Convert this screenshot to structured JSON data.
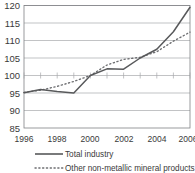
{
  "chart_data": {
    "type": "line",
    "title": "",
    "subtitle": "",
    "xlabel": "",
    "ylabel": "",
    "xlim": [
      1996,
      2006
    ],
    "ylim": [
      85,
      120
    ],
    "grid": true,
    "legend_position": "bottom",
    "y_ticks": [
      120,
      115,
      110,
      105,
      100,
      95,
      90,
      85
    ],
    "y_tick_labels": [
      "120",
      "115",
      "110",
      "105",
      "100",
      "95",
      "90",
      "85"
    ],
    "x_ticks": [
      1996,
      1998,
      2000,
      2002,
      2004,
      2006
    ],
    "x_tick_labels": [
      "1996",
      "1998",
      "2000",
      "2002",
      "2004",
      "2006"
    ],
    "x_minor_ticks": [
      1997,
      1999,
      2001,
      2003,
      2005
    ],
    "x": [
      1996,
      1997,
      1998,
      1999,
      2000,
      2001,
      2002,
      2003,
      2004,
      2005,
      2006
    ],
    "series": [
      {
        "name": "Total industry",
        "style": "solid",
        "color": "#58595b",
        "values": [
          95.1,
          96.0,
          95.4,
          95.0,
          100.0,
          101.9,
          101.8,
          105.0,
          107.5,
          112.5,
          119.5
        ]
      },
      {
        "name": "Other non-metallic mineral products",
        "style": "dotted",
        "color": "#6d6e71",
        "values": [
          95.2,
          95.8,
          96.9,
          98.3,
          100.0,
          103.0,
          104.6,
          105.2,
          106.8,
          109.8,
          112.4
        ]
      }
    ],
    "legend": [
      {
        "label": "Total industry",
        "style": "solid",
        "color": "#58595b"
      },
      {
        "label": "Other non-metallic mineral products",
        "style": "dotted",
        "color": "#6d6e71"
      }
    ]
  },
  "colors": {
    "background": "#ffffff",
    "gridline": "#a7a9ac",
    "axis": "#808285",
    "text": "#3a3a3a",
    "series_total_industry": "#58595b",
    "series_other_non_metallic": "#6d6e71"
  }
}
